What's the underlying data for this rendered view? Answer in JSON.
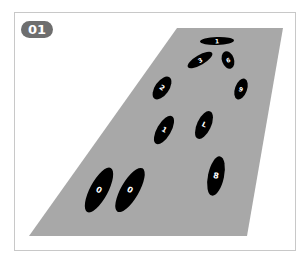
{
  "badge": {
    "label": "01"
  },
  "colors": {
    "floor": "#a8a8a8",
    "footprint": "#000000",
    "digit": "#ffffff",
    "badge": "#6e6e6e",
    "frame": "#c8c8c8"
  },
  "floor": {
    "points": "177,28 283,28 247,236 29,236"
  },
  "footprints": [
    {
      "digit": "1",
      "cx": 217,
      "cy": 41,
      "rx": 17,
      "ry": 4,
      "rot": -2,
      "tsize": 6
    },
    {
      "digit": "3",
      "cx": 200,
      "cy": 60,
      "rx": 14,
      "ry": 5,
      "rot": -30,
      "tsize": 6
    },
    {
      "digit": "6",
      "cx": 228,
      "cy": 60,
      "rx": 6,
      "ry": 9,
      "rot": -20,
      "tsize": 6
    },
    {
      "digit": "9",
      "cx": 241,
      "cy": 89,
      "rx": 6,
      "ry": 11,
      "rot": 20,
      "tsize": 6
    },
    {
      "digit": "2",
      "cx": 162,
      "cy": 88,
      "rx": 7,
      "ry": 13,
      "rot": 35,
      "tsize": 7
    },
    {
      "digit": "1",
      "cx": 164,
      "cy": 130,
      "rx": 7,
      "ry": 16,
      "rot": 30,
      "tsize": 7
    },
    {
      "digit": "L",
      "cx": 204,
      "cy": 125,
      "rx": 7,
      "ry": 15,
      "rot": 25,
      "tsize": 7
    },
    {
      "digit": "8",
      "cx": 216,
      "cy": 176,
      "rx": 8,
      "ry": 20,
      "rot": 12,
      "tsize": 8
    },
    {
      "digit": "0",
      "cx": 99,
      "cy": 190,
      "rx": 9,
      "ry": 25,
      "rot": 28,
      "tsize": 8
    },
    {
      "digit": "0",
      "cx": 130,
      "cy": 190,
      "rx": 9,
      "ry": 25,
      "rot": 30,
      "tsize": 8
    }
  ]
}
